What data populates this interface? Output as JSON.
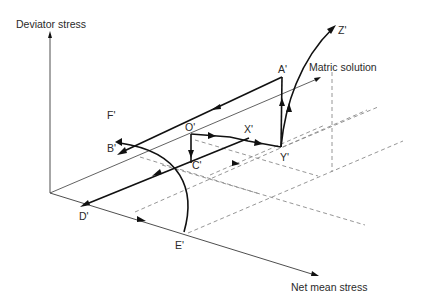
{
  "axes": {
    "vertical": "Deviator stress",
    "horizontal": "Net mean stress",
    "depth": "Matric solution"
  },
  "points": {
    "A": "A'",
    "B": "B'",
    "C": "C'",
    "D": "D'",
    "E": "E'",
    "F": "F'",
    "O": "O'",
    "X": "X'",
    "Y": "Y'",
    "Z": "Z'"
  },
  "colors": {
    "stress_path": "#111111",
    "axis": "#3a3a3a",
    "grid_dashed": "#8a8a8a",
    "background": "#ffffff"
  },
  "stress_paths": [
    {
      "name": "O-X-Y",
      "from": "O'",
      "via": "X'",
      "to": "Y'"
    },
    {
      "name": "Y-A",
      "from": "Y'",
      "to": "A'"
    },
    {
      "name": "A-B",
      "from": "A'",
      "to": "B'"
    },
    {
      "name": "O-C",
      "from": "O'",
      "to": "C'"
    },
    {
      "name": "C-D",
      "from": "X'",
      "via": "C'",
      "to": "D'"
    },
    {
      "name": "Y-Z",
      "from": "Y'",
      "to": "Z'",
      "shape": "curve"
    },
    {
      "name": "E-F",
      "from": "E'",
      "to": "F'",
      "shape": "curve"
    }
  ]
}
